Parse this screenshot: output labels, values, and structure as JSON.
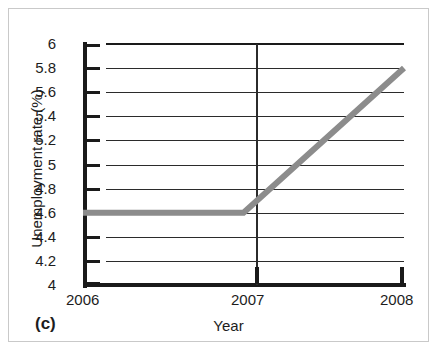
{
  "figure": {
    "panel_label": "(c)",
    "background_color": "#ffffff",
    "frame_color": "#c9c9c9"
  },
  "chart_data": {
    "type": "line",
    "title": "",
    "subtitle": "",
    "xlabel": "Year",
    "ylabel": "Unemployment rate (%)",
    "xlim": [
      2006,
      2008
    ],
    "ylim": [
      4,
      6
    ],
    "grid": true,
    "legend": "none",
    "x_tick_labels": [
      "2006",
      "2007",
      "2008"
    ],
    "x_ticks": [
      2006,
      2007,
      2008
    ],
    "y_ticks": [
      4,
      4.2,
      4.4,
      4.6,
      4.8,
      5,
      5.2,
      5.4,
      5.6,
      5.8,
      6
    ],
    "y_tick_labels": [
      "4",
      "4.2",
      "4.4",
      "4.6",
      "4.8",
      "5",
      "5.2",
      "5.4",
      "5.6",
      "5.8",
      "6"
    ],
    "series": [
      {
        "name": "Unemployment rate",
        "color": "#8c8c8c",
        "line_width": 6,
        "x": [
          2006,
          2007,
          2008
        ],
        "values": [
          4.6,
          4.6,
          5.8
        ]
      }
    ],
    "annotations": [
      {
        "label": "flat segment",
        "from_x": 2006,
        "to_x": 2007,
        "value": 4.6
      },
      {
        "label": "rising segment",
        "from_x": 2007,
        "to_x": 2008,
        "from_value": 4.6,
        "to_value": 5.8
      }
    ]
  }
}
